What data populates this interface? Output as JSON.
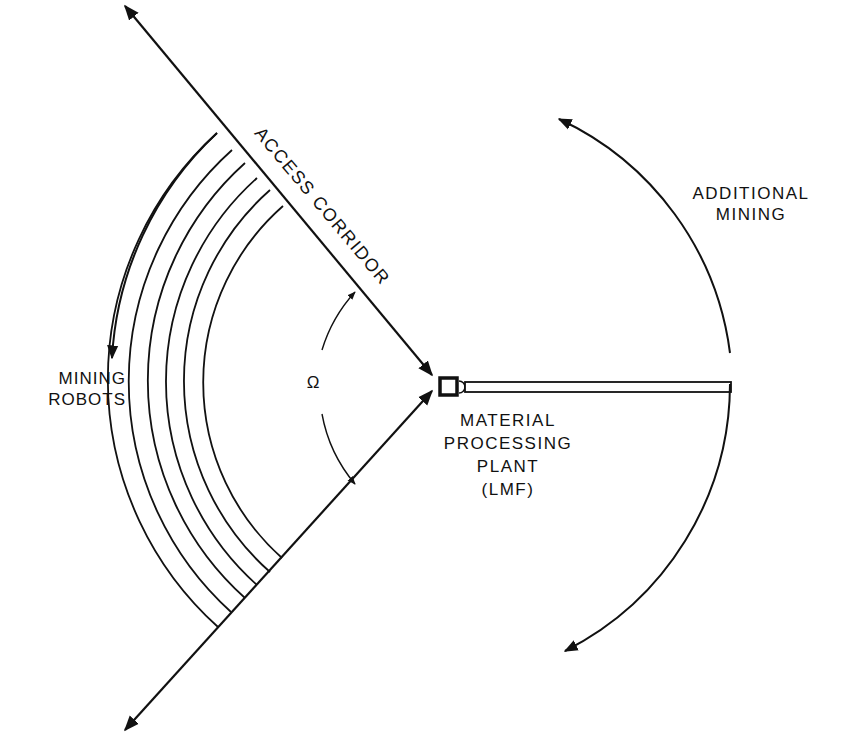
{
  "diagram": {
    "type": "lunar mining layout schematic",
    "colors": {
      "ink": "#111111",
      "background": "#ffffff"
    },
    "center": {
      "x": 438,
      "y": 383
    },
    "labels": {
      "access_corridor": "ACCESS CORRIDOR",
      "additional_mining": [
        "ADDITIONAL",
        "MINING"
      ],
      "mining_robots": [
        "MINING",
        "ROBOTS"
      ],
      "plant": [
        "MATERIAL",
        "PROCESSING",
        "PLANT",
        "(LMF)"
      ],
      "angle_symbol": "Ω"
    },
    "mining_arcs_count": 6
  }
}
